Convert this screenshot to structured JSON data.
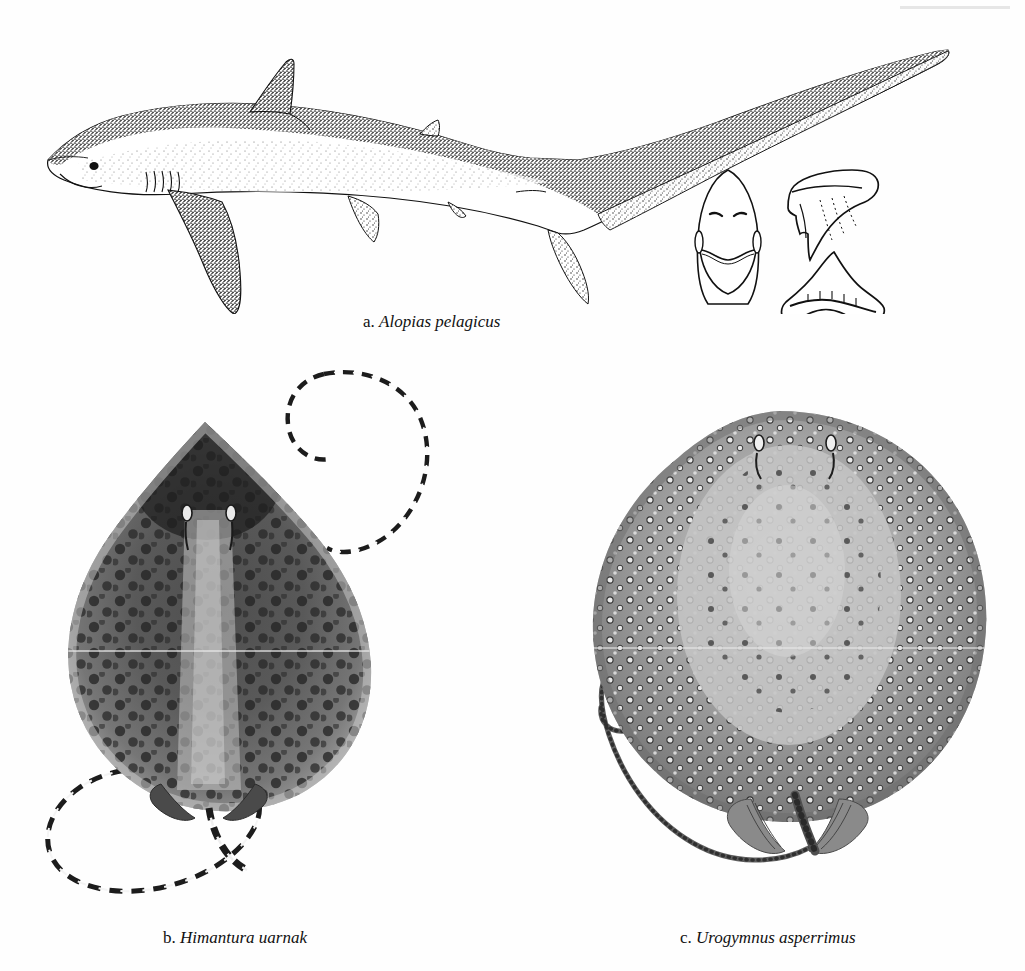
{
  "plate": {
    "background_color": "#fefefe",
    "ink_color": "#111111",
    "figure_count": 3
  },
  "figures": [
    {
      "label": "a.",
      "species": "Alopias pelagicus",
      "common_subject": "pelagic thresher shark",
      "view": "lateral whole body, left side",
      "caption_full": "a. Alopias pelagicus",
      "technique": "stipple pen-and-ink line drawing",
      "insets": [
        {
          "name": "ventral-head-inset",
          "description": "underside of head showing snout, nostrils and mouth"
        },
        {
          "name": "upper-tooth-inset",
          "description": "upper tooth, labial view"
        },
        {
          "name": "lower-tooth-inset",
          "description": "lower tooth, basal view"
        }
      ]
    },
    {
      "label": "b.",
      "species": "Himantura uarnak",
      "common_subject": "honeycomb whipray",
      "view": "dorsal view of disc with whip tail",
      "caption_full": "b. Himantura uarnak",
      "technique": "halftone wash, dark leopard-spotted disc",
      "tail": {
        "pattern": "banded black and white",
        "form": "long whip, loops below disc and again above right"
      }
    },
    {
      "label": "c.",
      "species": "Urogymnus asperrimus",
      "common_subject": "porcupine ray",
      "view": "dorsal view of disc with tail",
      "caption_full": "c. Urogymnus asperrimus",
      "technique": "halftone wash, pale thorny denticles over whole disc",
      "tail": {
        "pattern": "thorn-studded, unbanded",
        "form": "tapering, curled into spiral at tip"
      }
    }
  ],
  "captions": {
    "a": {
      "label": "a.",
      "name": "Alopias pelagicus"
    },
    "b": {
      "label": "b.",
      "name": "Himantura uarnak"
    },
    "c": {
      "label": "c.",
      "name": "Urogymnus asperrimus"
    }
  },
  "colors": {
    "paper": "#fefefe",
    "ink": "#111111",
    "ray_b_disc_mid": "#6a6a6a",
    "ray_b_disc_dark": "#2a2a2a",
    "ray_b_spot": "#262626",
    "ray_c_disc_mid": "#8d8d8d",
    "ray_c_disc_light": "#c9c9c9",
    "ray_c_thorn": "#efefef"
  }
}
